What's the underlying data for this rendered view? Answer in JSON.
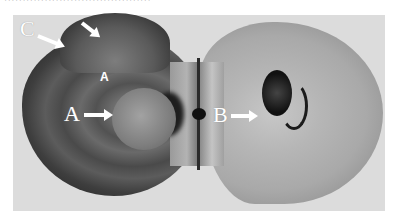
{
  "figure": {
    "caption_fragment": "········································",
    "labels": {
      "A": "A",
      "B": "B",
      "C": "C",
      "A_small": "A"
    },
    "colors": {
      "background": "#dcdcdc",
      "label_color": "#ffffff"
    }
  }
}
